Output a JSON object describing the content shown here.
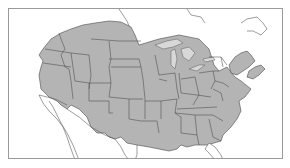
{
  "map": {
    "region": "North America (United States and southern Canada)",
    "highlighted_area": "range (shaded)",
    "colors": {
      "range_fill": "#b4b4b4",
      "boundaries": "#4a4a4a",
      "background": "#ffffff",
      "frame": "#9a9a9a"
    },
    "legend": null,
    "labels": []
  }
}
